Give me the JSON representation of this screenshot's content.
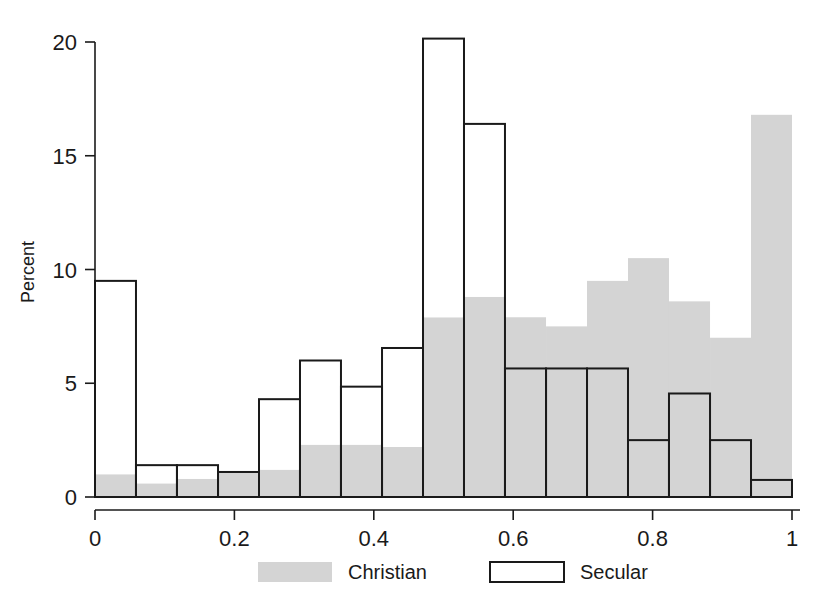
{
  "chart_data": {
    "type": "bar",
    "subtype": "overlaid-histogram",
    "title": "",
    "xlabel": "",
    "ylabel": "Percent",
    "xlim": [
      0,
      1
    ],
    "ylim": [
      0,
      21
    ],
    "xticks": [
      0,
      0.2,
      0.4,
      0.6,
      0.8,
      1
    ],
    "xticklabels": [
      "0",
      "0.2",
      "0.4",
      "0.6",
      "0.8",
      "1"
    ],
    "yticks": [
      0,
      5,
      10,
      15,
      20
    ],
    "yticklabels": [
      "0",
      "5",
      "10",
      "15",
      "20"
    ],
    "grid": false,
    "legend_position": "bottom",
    "bin_edges": [
      0.0,
      0.0588,
      0.1176,
      0.1765,
      0.2353,
      0.2941,
      0.3529,
      0.4118,
      0.4706,
      0.5294,
      0.5882,
      0.6471,
      0.7059,
      0.7647,
      0.8235,
      0.8824,
      0.9412,
      1.0
    ],
    "bin_centers": [
      0.029,
      0.088,
      0.147,
      0.206,
      0.265,
      0.324,
      0.382,
      0.441,
      0.5,
      0.559,
      0.618,
      0.676,
      0.735,
      0.794,
      0.853,
      0.912,
      0.971
    ],
    "series": [
      {
        "name": "Christian",
        "style": "filled",
        "color": "#d4d4d4",
        "values": [
          1.0,
          0.6,
          0.8,
          1.1,
          1.2,
          2.3,
          2.3,
          2.2,
          7.9,
          8.8,
          7.9,
          7.5,
          9.5,
          10.5,
          8.6,
          7.0,
          16.8
        ]
      },
      {
        "name": "Secular",
        "style": "outline",
        "color": "#ffffff",
        "edge_color": "#1a1a1a",
        "values": [
          9.5,
          1.4,
          1.4,
          1.1,
          4.3,
          6.0,
          4.85,
          6.55,
          20.15,
          16.4,
          5.65,
          5.65,
          5.65,
          2.5,
          4.55,
          2.5,
          0.75,
          3.9
        ]
      }
    ],
    "legend": [
      {
        "label": "Christian",
        "swatch": "filled-gray"
      },
      {
        "label": "Secular",
        "swatch": "outline-white"
      }
    ]
  },
  "axes": {
    "ylabel": "Percent"
  },
  "colors": {
    "christian_fill": "#d4d4d4",
    "secular_fill": "#ffffff",
    "outline": "#1a1a1a",
    "axis": "#1a1a1a",
    "background": "#ffffff"
  }
}
